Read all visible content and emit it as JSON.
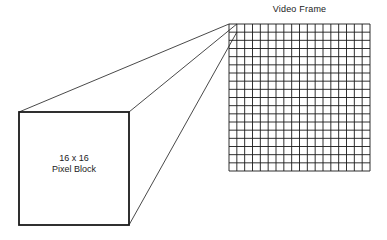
{
  "diagram": {
    "frame": {
      "title": "Video Frame",
      "grid_columns": 18,
      "grid_rows": 18,
      "x": 229,
      "y": 24,
      "width": 141,
      "height": 147
    },
    "block": {
      "size_label": "16 x 16",
      "name_label": "Pixel Block",
      "x": 19,
      "y": 112,
      "width": 110,
      "height": 113
    },
    "projection_lines": [
      {
        "from": "block-top-left",
        "to": "frame-cell-top-left"
      },
      {
        "from": "block-top-right",
        "to": "frame-cell-top-right"
      },
      {
        "from": "block-bottom-right",
        "to": "frame-cell-bottom-right"
      }
    ],
    "colors": {
      "line": "#1a1a1a",
      "background": "#ffffff"
    }
  }
}
